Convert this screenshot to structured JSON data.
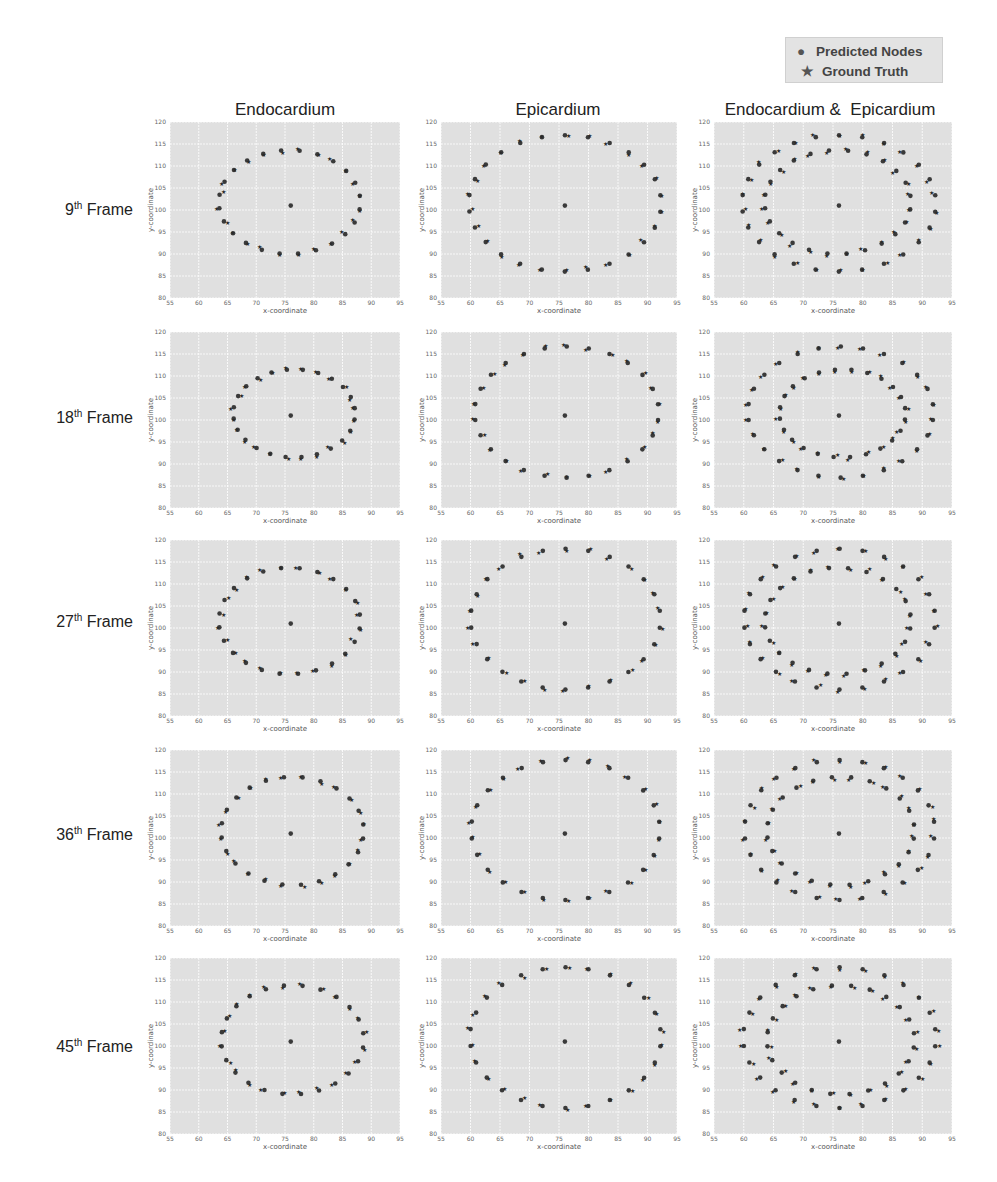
{
  "legend": {
    "items": [
      {
        "label": "Predicted Nodes",
        "marker": "circle"
      },
      {
        "label": "Ground Truth",
        "marker": "star"
      }
    ]
  },
  "columns": [
    {
      "title": "Endocardium"
    },
    {
      "title": "Epicardium"
    },
    {
      "title": "Endocardium &  Epicardium"
    }
  ],
  "rows": [
    {
      "label_num": "9",
      "label_sup": "th",
      "label_word": "Frame"
    },
    {
      "label_num": "18",
      "label_sup": "th",
      "label_word": "Frame"
    },
    {
      "label_num": "27",
      "label_sup": "th",
      "label_word": "Frame"
    },
    {
      "label_num": "36",
      "label_sup": "th",
      "label_word": "Frame"
    },
    {
      "label_num": "45",
      "label_sup": "th",
      "label_word": "Frame"
    }
  ],
  "colors": {
    "plot_bg": "#e0e0e0",
    "grid": "#ffffff",
    "predicted": "#3a3a3a",
    "ground_truth": "#2a2a2a"
  },
  "chart_data": {
    "type": "scatter",
    "title": "",
    "layout": "5 rows (frames) x 3 columns (contours) grid of scatter plots",
    "xlabel": "x-coordinate",
    "ylabel": "y-coordinate",
    "xlim": [
      55,
      95
    ],
    "ylim": [
      80,
      120
    ],
    "xticks": [
      55,
      60,
      65,
      70,
      75,
      80,
      85,
      90,
      95
    ],
    "yticks": [
      80,
      85,
      90,
      95,
      100,
      105,
      110,
      115,
      120
    ],
    "grid": true,
    "legend": [
      "Predicted Nodes",
      "Ground Truth"
    ],
    "legend_position": "upper right (outside)",
    "center_point": [
      76,
      101
    ],
    "panels": [
      {
        "frame": "9th Frame",
        "contour": "Endocardium",
        "ellipses": [
          {
            "cx": 75.8,
            "cy": 101.8,
            "rx": 12.3,
            "ry": 11.8,
            "n": 24
          }
        ],
        "approx_points_y_range": [
          90,
          114
        ],
        "approx_points_x_range": [
          63.5,
          88
        ]
      },
      {
        "frame": "9th Frame",
        "contour": "Epicardium",
        "ellipses": [
          {
            "cx": 76,
            "cy": 101.5,
            "rx": 16.3,
            "ry": 15.5,
            "n": 26
          }
        ],
        "approx_points_y_range": [
          86,
          117.5
        ],
        "approx_points_x_range": [
          59.5,
          92.2
        ]
      },
      {
        "frame": "9th Frame",
        "contour": "Endocardium & Epicardium",
        "ellipses": [
          {
            "cx": 75.8,
            "cy": 101.8,
            "rx": 12.3,
            "ry": 11.8,
            "n": 24
          },
          {
            "cx": 76,
            "cy": 101.5,
            "rx": 16.3,
            "ry": 15.5,
            "n": 26
          }
        ]
      },
      {
        "frame": "18th Frame",
        "contour": "Endocardium",
        "ellipses": [
          {
            "cx": 76.6,
            "cy": 101.5,
            "rx": 10.6,
            "ry": 10.0,
            "n": 24
          }
        ],
        "approx_points_y_range": [
          91.5,
          111.5
        ],
        "approx_points_x_range": [
          66,
          87.2
        ]
      },
      {
        "frame": "18th Frame",
        "contour": "Epicardium",
        "ellipses": [
          {
            "cx": 76.3,
            "cy": 101.8,
            "rx": 15.6,
            "ry": 14.9,
            "n": 26
          }
        ],
        "approx_points_y_range": [
          87,
          116.7
        ],
        "approx_points_x_range": [
          60.8,
          91.8
        ]
      },
      {
        "frame": "18th Frame",
        "contour": "Endocardium & Epicardium",
        "ellipses": [
          {
            "cx": 76.6,
            "cy": 101.5,
            "rx": 10.6,
            "ry": 10.0,
            "n": 24
          },
          {
            "cx": 76.3,
            "cy": 101.8,
            "rx": 15.6,
            "ry": 14.9,
            "n": 26
          }
        ]
      },
      {
        "frame": "27th Frame",
        "contour": "Endocardium",
        "ellipses": [
          {
            "cx": 75.8,
            "cy": 101.6,
            "rx": 12.3,
            "ry": 12.1,
            "n": 24
          }
        ],
        "approx_points_y_range": [
          89.5,
          113.7
        ],
        "approx_points_x_range": [
          63.5,
          88.2
        ]
      },
      {
        "frame": "27th Frame",
        "contour": "Epicardium",
        "ellipses": [
          {
            "cx": 76.1,
            "cy": 102,
            "rx": 16.1,
            "ry": 16.0,
            "n": 26
          }
        ],
        "approx_points_y_range": [
          86,
          118
        ],
        "approx_points_x_range": [
          60,
          92.2
        ]
      },
      {
        "frame": "27th Frame",
        "contour": "Endocardium & Epicardium",
        "ellipses": [
          {
            "cx": 75.8,
            "cy": 101.6,
            "rx": 12.3,
            "ry": 12.1,
            "n": 24
          },
          {
            "cx": 76.1,
            "cy": 102,
            "rx": 16.1,
            "ry": 16.0,
            "n": 26
          }
        ]
      },
      {
        "frame": "36th Frame",
        "contour": "Endocardium",
        "ellipses": [
          {
            "cx": 76.3,
            "cy": 101.6,
            "rx": 12.4,
            "ry": 12.3,
            "n": 24
          }
        ],
        "approx_points_y_range": [
          89.3,
          113.9
        ],
        "approx_points_x_range": [
          64,
          88.7
        ]
      },
      {
        "frame": "36th Frame",
        "contour": "Epicardium",
        "ellipses": [
          {
            "cx": 76.1,
            "cy": 101.8,
            "rx": 16.0,
            "ry": 15.9,
            "n": 26
          }
        ],
        "approx_points_y_range": [
          86,
          117.7
        ],
        "approx_points_x_range": [
          60,
          92.1
        ]
      },
      {
        "frame": "36th Frame",
        "contour": "Endocardium & Epicardium",
        "ellipses": [
          {
            "cx": 76.3,
            "cy": 101.6,
            "rx": 12.4,
            "ry": 12.3,
            "n": 24
          },
          {
            "cx": 76.1,
            "cy": 101.8,
            "rx": 16.0,
            "ry": 15.9,
            "n": 26
          }
        ]
      },
      {
        "frame": "45th Frame",
        "contour": "Endocardium",
        "ellipses": [
          {
            "cx": 76.3,
            "cy": 101.4,
            "rx": 12.4,
            "ry": 12.4,
            "n": 24
          }
        ],
        "approx_points_y_range": [
          89,
          113.8
        ],
        "approx_points_x_range": [
          64,
          88.8
        ]
      },
      {
        "frame": "45th Frame",
        "contour": "Epicardium",
        "ellipses": [
          {
            "cx": 76.1,
            "cy": 101.9,
            "rx": 16.2,
            "ry": 16.0,
            "n": 26
          }
        ],
        "approx_points_y_range": [
          85.9,
          117.9
        ],
        "approx_points_x_range": [
          59.8,
          92.2
        ]
      },
      {
        "frame": "45th Frame",
        "contour": "Endocardium & Epicardium",
        "ellipses": [
          {
            "cx": 76.3,
            "cy": 101.4,
            "rx": 12.4,
            "ry": 12.4,
            "n": 24
          },
          {
            "cx": 76.1,
            "cy": 101.9,
            "rx": 16.2,
            "ry": 16.0,
            "n": 26
          }
        ]
      }
    ]
  }
}
